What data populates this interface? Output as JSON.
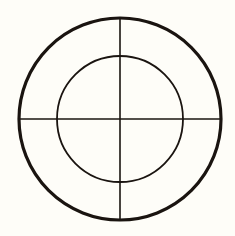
{
  "diagram": {
    "type": "concentric-circles-crosshair",
    "background": "#fefdf8",
    "stroke_color": "#1a1410",
    "center": {
      "x": 120,
      "y": 119
    },
    "outer_circle": {
      "r": 101,
      "stroke_width": 3.2
    },
    "inner_circle": {
      "r": 63,
      "stroke_width": 1.8
    },
    "crosshair": {
      "stroke_width": 1.6
    }
  }
}
